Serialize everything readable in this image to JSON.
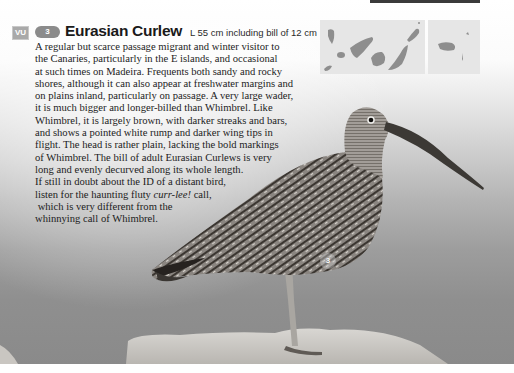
{
  "header": {
    "status_badge": "VU",
    "species_number": "3",
    "species_name": "Eurasian Curlew",
    "size_text": "L 55 cm including bill of 12 cm"
  },
  "description": {
    "lines": [
      "A regular but scarce passage migrant and winter visitor to",
      "the Canaries, particularly in the E islands, and occasional",
      "at such times on Madeira. Frequents both sandy and rocky",
      "shores, although it can also appear at freshwater margins and",
      "on plains inland, particularly on passage. A very large wader,",
      "it is much bigger and longer-billed than Whimbrel. Like",
      "Whimbrel, it is largely brown, with darker streaks and bars,",
      "and shows a pointed white rump and darker wing tips in",
      "flight. The head is rather plain, lacking the bold markings",
      "of Whimbrel. The bill of adult Eurasian Curlews is very",
      "long and evenly decurved along its whole length.",
      "If still in doubt about the ID of a distant bird,"
    ],
    "call_line_pre": "listen for the haunting fluty ",
    "call_line_italic": "curr-lee!",
    "call_line_post": " call,",
    "final_lines": [
      " which is very different from the",
      "whinnying call of Whimbrel."
    ]
  },
  "maps": {
    "panels": [
      "Canary Islands",
      "Madeira"
    ],
    "fill_color": "#8e8e8e",
    "background_color": "#e6e6e6"
  },
  "photo": {
    "subject": "Eurasian Curlew standing on rock",
    "marker_label": "3"
  }
}
